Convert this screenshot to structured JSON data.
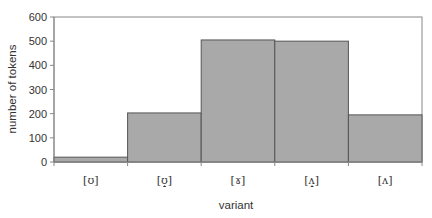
{
  "chart_data": {
    "type": "bar",
    "title": "",
    "xlabel": "variant",
    "ylabel": "number of tokens",
    "categories": [
      "[ʊ]",
      "[ʊ̝]",
      "[ɤ]",
      "[ʌ̝]",
      "[ʌ]"
    ],
    "values": [
      20,
      203,
      505,
      500,
      195
    ],
    "ylim": [
      0,
      600
    ],
    "yticks": [
      0,
      100,
      200,
      300,
      400,
      500,
      600
    ],
    "grid": false,
    "legend": null,
    "bar_gap": 0,
    "colors": {
      "bar_fill": "#a9a9a9",
      "bar_edge": "#555555",
      "axis": "#888888"
    }
  }
}
